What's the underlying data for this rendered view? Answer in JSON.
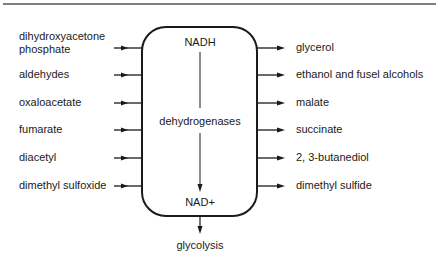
{
  "diagram": {
    "center": {
      "top_label": "NADH",
      "middle_label": "dehydrogenases",
      "bottom_label": "NAD+",
      "output_label": "glycolysis"
    },
    "inputs": [
      {
        "label_line1": "dihydroxyacetone",
        "label_line2": "phosphate"
      },
      {
        "label_line1": "aldehydes"
      },
      {
        "label_line1": "oxaloacetate"
      },
      {
        "label_line1": "fumarate"
      },
      {
        "label_line1": "diacetyl"
      },
      {
        "label_line1": "dimethyl sulfoxide"
      }
    ],
    "outputs": [
      {
        "label": "glycerol"
      },
      {
        "label": "ethanol and fusel alcohols"
      },
      {
        "label": "malate"
      },
      {
        "label": "succinate"
      },
      {
        "label": "2, 3-butanediol"
      },
      {
        "label": "dimethyl sulfide"
      }
    ],
    "colors": {
      "ink": "#1a1a1a",
      "rule": "#555555",
      "background": "#ffffff"
    }
  }
}
